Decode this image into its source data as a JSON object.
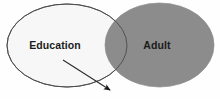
{
  "diagram": {
    "type": "venn",
    "title": "",
    "background_color": "#fefefe",
    "sets": [
      {
        "key": "education",
        "label": "Education",
        "fill_color": "#f7f7f7",
        "stroke_color": "#4a4a4a",
        "cx": 67,
        "cy": 45.5,
        "rx": 60,
        "ry": 41.5,
        "label_x": 55,
        "label_y": 49
      },
      {
        "key": "adult",
        "label": "Adult",
        "fill_color": "#8c8c8c",
        "stroke_color": "#8c8c8c",
        "cx": 159.5,
        "cy": 45,
        "rx": 54.5,
        "ry": 42,
        "label_x": 157,
        "label_y": 49
      }
    ],
    "intersection": {
      "label": "",
      "fill_color": "#8c8c8c"
    },
    "arrow": {
      "label": "",
      "color": "#2b2b2b",
      "x1": 63,
      "y1": 60,
      "x2": 110,
      "y2": 90,
      "head_color": "#1a1a1a"
    }
  }
}
